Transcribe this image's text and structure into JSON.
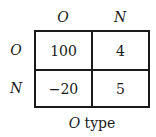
{
  "matrix": {
    "column_headers": [
      "O",
      "N"
    ],
    "row_headers": [
      "O",
      "N"
    ],
    "cells": [
      [
        "100",
        "4"
      ],
      [
        "−20",
        "5"
      ]
    ],
    "caption_italic": "O",
    "caption_rest": " type"
  }
}
